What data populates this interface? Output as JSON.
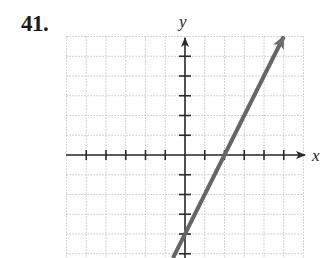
{
  "problem": {
    "number": "41."
  },
  "chart_data": {
    "type": "line",
    "title": "",
    "xlabel": "x",
    "ylabel": "y",
    "xlim": [
      -6,
      6
    ],
    "ylim": [
      -5.2,
      6
    ],
    "grid": true,
    "grid_style": "dotted",
    "tick_spacing": 1,
    "series": [
      {
        "name": "y = 2x - 4",
        "equation": "y = 2x - 4",
        "slope": 2,
        "y_intercept": -4,
        "x_intercept": 2,
        "x": [
          0.6,
          5
        ],
        "y": [
          -2.8,
          6
        ],
        "arrow_end": true,
        "color": "#666666"
      }
    ],
    "annotations": []
  },
  "colors": {
    "axis": "#2a2a2a",
    "grid": "#b8b8b8",
    "line": "#6e6e6e"
  }
}
